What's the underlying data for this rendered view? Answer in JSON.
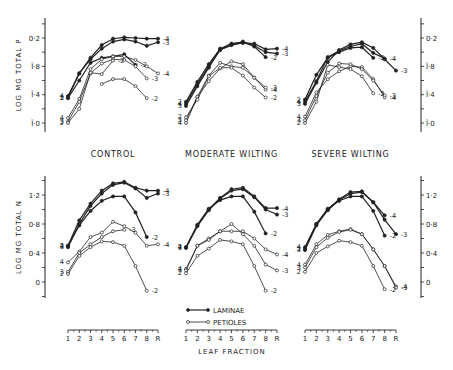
{
  "chart_data": {
    "type": "line",
    "title": "",
    "x_categories": [
      "1",
      "2",
      "3",
      "4",
      "5",
      "6",
      "7",
      "8",
      "R"
    ],
    "xlabel": "LEAF FRACTION",
    "legend": [
      {
        "name": "LAMINAE",
        "marker": "filled-circle"
      },
      {
        "name": "PETIOLES",
        "marker": "open-circle"
      }
    ],
    "legend_position": "bottom-center",
    "grid": false,
    "rows": [
      {
        "ylabel": "LOG MG TOTAL P",
        "yticks": [
          "Ī·0",
          "Ī·4",
          "Ī·8",
          "0·2"
        ],
        "ytick_values": [
          -1.0,
          -0.6,
          -0.2,
          0.2
        ],
        "ylim": [
          -1.1,
          0.3
        ],
        "note": "bar notation: Ī·0 = -1.0, Ī·4 = -0.6, Ī·8 = -0.2",
        "panels": [
          {
            "title": "CONTROL",
            "series": [
              {
                "tissue": "LAMINAE",
                "line": "4",
                "start_x": 1,
                "values": [
                  -0.62,
                  -0.3,
                  -0.08,
                  0.1,
                  0.19,
                  0.21,
                  0.2,
                  0.19,
                  0.19
                ]
              },
              {
                "tissue": "LAMINAE",
                "line": "3",
                "start_x": 1,
                "values": [
                  -0.64,
                  -0.3,
                  -0.1,
                  0.05,
                  0.15,
                  0.18,
                  0.15,
                  0.09,
                  0.14
                ]
              },
              {
                "tissue": "LAMINAE",
                "line": "2",
                "start_x": 1,
                "values": [
                  -0.65,
                  -0.4,
                  -0.15,
                  -0.08,
                  -0.06,
                  -0.03,
                  -0.18,
                  null,
                  null
                ]
              },
              {
                "tissue": "PETIOLES",
                "line": "4",
                "start_x": 1,
                "values": [
                  -0.93,
                  -0.66,
                  -0.24,
                  -0.1,
                  -0.06,
                  -0.06,
                  -0.11,
                  -0.2,
                  -0.3
                ]
              },
              {
                "tissue": "PETIOLES",
                "line": "3",
                "start_x": 1,
                "values": [
                  -0.98,
                  -0.7,
                  -0.3,
                  -0.16,
                  -0.1,
                  -0.11,
                  -0.2,
                  -0.37,
                  null
                ]
              },
              {
                "tissue": "PETIOLES",
                "line": "2",
                "start_x": 1,
                "values": [
                  -1.0,
                  -0.8,
                  -0.29,
                  -0.31,
                  -0.12,
                  null,
                  null,
                  null,
                  null
                ]
              },
              {
                "tissue": "PETIOLES",
                "line": "2b",
                "start_x": 4,
                "values": [
                  null,
                  null,
                  null,
                  -0.45,
                  -0.38,
                  -0.38,
                  -0.48,
                  -0.65,
                  null
                ]
              }
            ]
          },
          {
            "title": "MODERATE WILTING",
            "series": [
              {
                "tissue": "LAMINAE",
                "line": "4",
                "start_x": 1,
                "values": [
                  -0.73,
                  -0.45,
                  -0.2,
                  0.03,
                  0.1,
                  0.13,
                  0.12,
                  0.04,
                  0.05
                ]
              },
              {
                "tissue": "LAMINAE",
                "line": "3",
                "start_x": 1,
                "values": [
                  -0.76,
                  -0.48,
                  -0.22,
                  0.04,
                  0.11,
                  0.15,
                  0.09,
                  0.0,
                  -0.02
                ]
              },
              {
                "tissue": "LAMINAE",
                "line": "2",
                "start_x": 1,
                "values": [
                  -0.7,
                  -0.42,
                  -0.17,
                  0.05,
                  0.12,
                  0.14,
                  0.08,
                  -0.07,
                  null
                ]
              },
              {
                "tissue": "PETIOLES",
                "line": "4",
                "start_x": 1,
                "values": [
                  -1.0,
                  -0.63,
                  -0.33,
                  -0.15,
                  -0.2,
                  -0.22,
                  -0.36,
                  -0.53,
                  null
                ]
              },
              {
                "tissue": "PETIOLES",
                "line": "3",
                "start_x": 1,
                "values": [
                  -0.96,
                  -0.63,
                  -0.41,
                  -0.23,
                  -0.13,
                  -0.17,
                  -0.36,
                  -0.5,
                  null
                ]
              },
              {
                "tissue": "PETIOLES",
                "line": "2",
                "start_x": 1,
                "values": [
                  -0.92,
                  -0.67,
                  -0.34,
                  -0.22,
                  -0.22,
                  -0.33,
                  -0.5,
                  -0.64,
                  null
                ]
              }
            ]
          },
          {
            "title": "SEVERE WILTING",
            "series": [
              {
                "tissue": "LAMINAE",
                "line": "4",
                "start_x": 1,
                "values": [
                  -0.7,
                  -0.41,
                  -0.07,
                  0.02,
                  0.08,
                  0.12,
                  -0.01,
                  -0.09,
                  null
                ]
              },
              {
                "tissue": "LAMINAE",
                "line": "3",
                "start_x": 1,
                "values": [
                  -0.73,
                  -0.43,
                  -0.14,
                  0.03,
                  0.11,
                  0.14,
                  0.06,
                  -0.1,
                  -0.26
                ]
              },
              {
                "tissue": "LAMINAE",
                "line": "2",
                "start_x": 1,
                "values": [
                  -0.67,
                  -0.32,
                  -0.08,
                  0.0,
                  0.06,
                  0.07,
                  -0.08,
                  null,
                  null
                ]
              },
              {
                "tissue": "PETIOLES",
                "line": "4",
                "start_x": 1,
                "values": [
                  -0.91,
                  -0.57,
                  -0.38,
                  -0.27,
                  -0.2,
                  -0.21,
                  -0.38,
                  -0.64,
                  null
                ]
              },
              {
                "tissue": "PETIOLES",
                "line": "3",
                "start_x": 1,
                "values": [
                  -0.96,
                  -0.62,
                  -0.29,
                  -0.16,
                  -0.17,
                  -0.24,
                  -0.4,
                  -0.61,
                  null
                ]
              },
              {
                "tissue": "PETIOLES",
                "line": "2",
                "start_x": 1,
                "values": [
                  -1.0,
                  -0.7,
                  -0.18,
                  -0.21,
                  -0.24,
                  -0.34,
                  -0.58,
                  null,
                  null
                ]
              }
            ]
          }
        ]
      },
      {
        "ylabel": "LOG MG TOTAL N",
        "yticks": [
          "0",
          "0·4",
          "0·8",
          "1·2"
        ],
        "ytick_values": [
          0.0,
          0.4,
          0.8,
          1.2
        ],
        "ylim": [
          -0.2,
          1.4
        ],
        "panels": [
          {
            "title": "CONTROL",
            "series": [
              {
                "tissue": "LAMINAE",
                "line": "4",
                "start_x": 1,
                "values": [
                  0.5,
                  0.85,
                  1.08,
                  1.26,
                  1.36,
                  1.38,
                  1.3,
                  1.26,
                  1.26
                ]
              },
              {
                "tissue": "LAMINAE",
                "line": "3",
                "start_x": 1,
                "values": [
                  0.48,
                  0.8,
                  1.05,
                  1.22,
                  1.34,
                  1.37,
                  1.29,
                  1.16,
                  1.22
                ]
              },
              {
                "tissue": "LAMINAE",
                "line": "2",
                "start_x": 1,
                "values": [
                  0.5,
                  0.78,
                  0.98,
                  1.12,
                  1.18,
                  1.18,
                  0.96,
                  0.62,
                  null
                ]
              },
              {
                "tissue": "PETIOLES",
                "line": "4",
                "start_x": 1,
                "values": [
                  0.27,
                  0.42,
                  0.62,
                  0.68,
                  0.83,
                  0.77,
                  0.68,
                  0.5,
                  0.52
                ]
              },
              {
                "tissue": "PETIOLES",
                "line": "3",
                "start_x": 1,
                "values": [
                  0.14,
                  0.4,
                  0.52,
                  0.62,
                  0.7,
                  0.72,
                  null,
                  null,
                  null
                ]
              },
              {
                "tissue": "PETIOLES",
                "line": "2",
                "start_x": 1,
                "values": [
                  0.11,
                  0.36,
                  0.48,
                  0.56,
                  0.55,
                  0.5,
                  0.22,
                  -0.12,
                  null
                ]
              }
            ]
          },
          {
            "title": "MODERATE WILTING",
            "series": [
              {
                "tissue": "LAMINAE",
                "line": "4",
                "start_x": 1,
                "values": [
                  0.48,
                  0.78,
                  1.0,
                  1.16,
                  1.28,
                  1.3,
                  1.18,
                  1.02,
                  1.02
                ]
              },
              {
                "tissue": "LAMINAE",
                "line": "3",
                "start_x": 1,
                "values": [
                  0.47,
                  0.77,
                  0.99,
                  1.15,
                  1.26,
                  1.28,
                  1.17,
                  1.0,
                  0.93
                ]
              },
              {
                "tissue": "LAMINAE",
                "line": "2",
                "start_x": 1,
                "values": [
                  0.48,
                  0.79,
                  1.01,
                  1.13,
                  1.18,
                  1.18,
                  0.97,
                  0.67,
                  null
                ]
              },
              {
                "tissue": "PETIOLES",
                "line": "4",
                "start_x": 1,
                "values": [
                  0.18,
                  0.5,
                  0.6,
                  0.7,
                  0.7,
                  0.7,
                  0.6,
                  0.45,
                  0.38
                ]
              },
              {
                "tissue": "PETIOLES",
                "line": "3",
                "start_x": 1,
                "values": [
                  0.16,
                  0.5,
                  0.58,
                  0.7,
                  0.8,
                  0.66,
                  0.5,
                  0.24,
                  0.16
                ]
              },
              {
                "tissue": "PETIOLES",
                "line": "2",
                "start_x": 1,
                "values": [
                  0.12,
                  0.36,
                  0.46,
                  0.58,
                  0.56,
                  0.52,
                  0.22,
                  -0.12,
                  null
                ]
              }
            ]
          },
          {
            "title": "SEVERE WILTING",
            "series": [
              {
                "tissue": "LAMINAE",
                "line": "4",
                "start_x": 1,
                "values": [
                  0.48,
                  0.8,
                  1.0,
                  1.14,
                  1.24,
                  1.25,
                  1.1,
                  0.92,
                  null
                ]
              },
              {
                "tissue": "LAMINAE",
                "line": "3",
                "start_x": 1,
                "values": [
                  0.44,
                  0.78,
                  0.99,
                  1.13,
                  1.22,
                  1.24,
                  1.1,
                  0.86,
                  0.66
                ]
              },
              {
                "tissue": "LAMINAE",
                "line": "2",
                "start_x": 1,
                "values": [
                  0.46,
                  0.8,
                  1.01,
                  1.12,
                  1.18,
                  1.18,
                  0.98,
                  0.64,
                  null
                ]
              },
              {
                "tissue": "PETIOLES",
                "line": "4",
                "start_x": 1,
                "values": [
                  0.24,
                  0.52,
                  0.65,
                  0.7,
                  0.73,
                  0.66,
                  0.45,
                  0.22,
                  -0.06
                ]
              },
              {
                "tissue": "PETIOLES",
                "line": "3",
                "start_x": 1,
                "values": [
                  0.2,
                  0.48,
                  0.61,
                  0.69,
                  0.72,
                  0.66,
                  0.45,
                  0.22,
                  -0.08
                ]
              },
              {
                "tissue": "PETIOLES",
                "line": "2",
                "start_x": 1,
                "values": [
                  0.14,
                  0.4,
                  0.49,
                  0.57,
                  0.55,
                  0.5,
                  0.22,
                  -0.1,
                  null
                ]
              }
            ]
          }
        ]
      }
    ]
  }
}
